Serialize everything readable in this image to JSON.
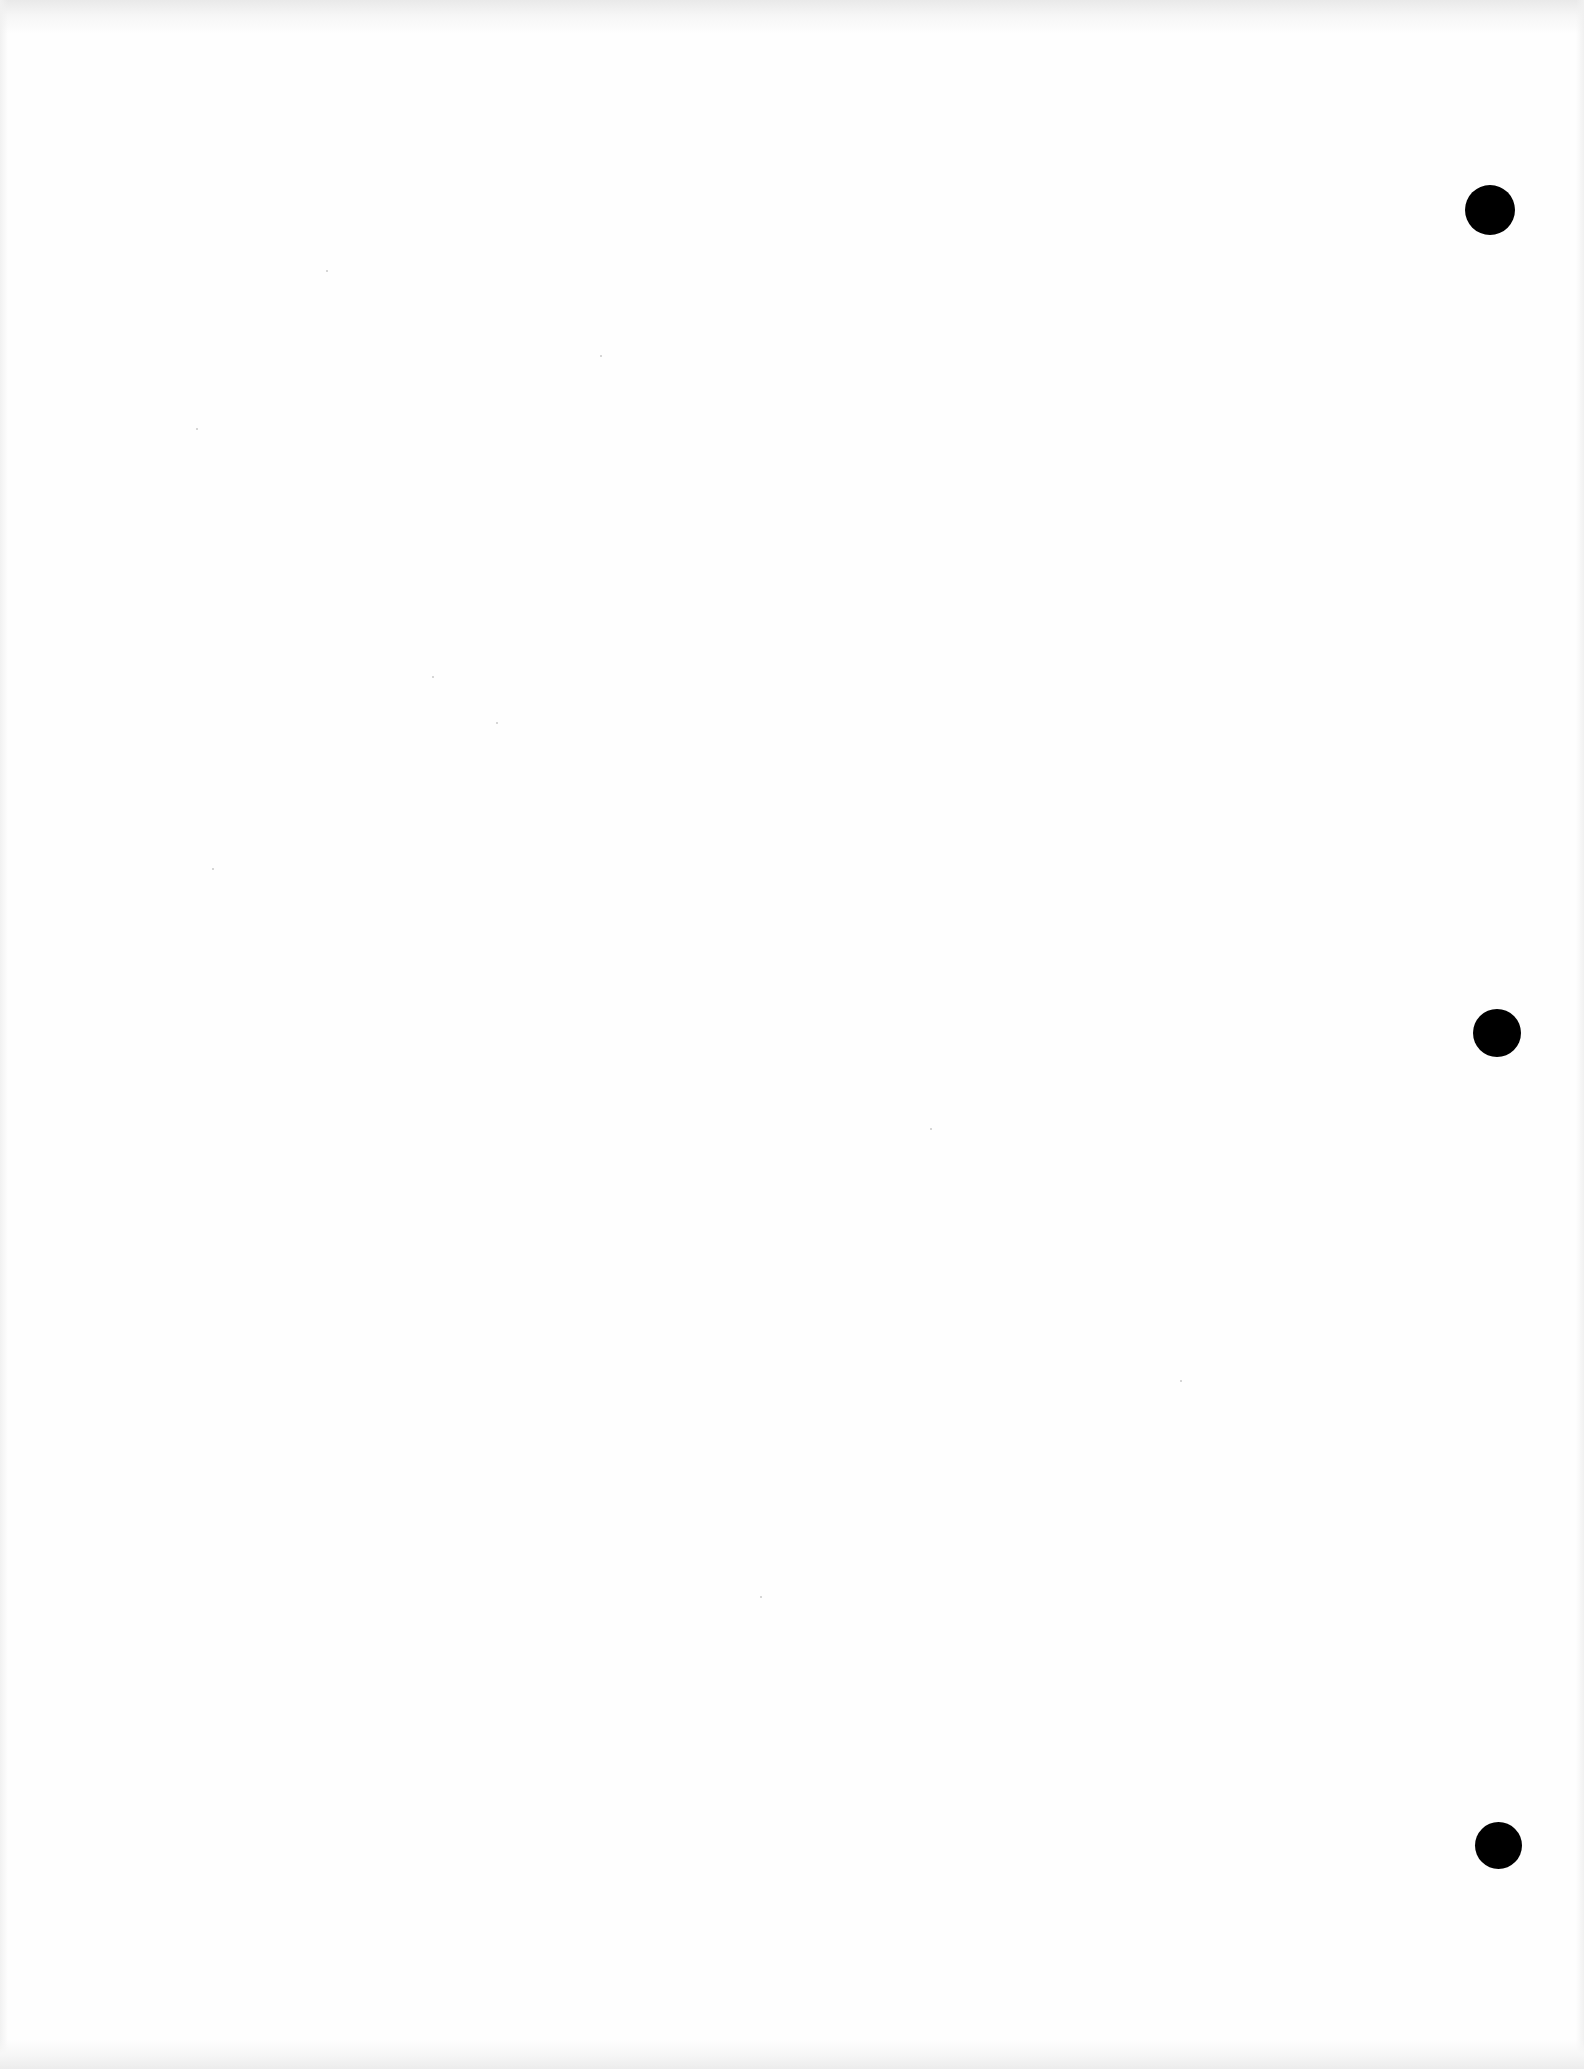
{
  "document": {
    "type": "blank scanned page",
    "text_content": "",
    "background_color": "#fefefe",
    "punch_holes": [
      {
        "cx": 1490,
        "cy": 210,
        "diameter": 50,
        "color": "#000000"
      },
      {
        "cx": 1497,
        "cy": 1033,
        "diameter": 48,
        "color": "#000000"
      },
      {
        "cx": 1498,
        "cy": 1845,
        "diameter": 47,
        "color": "#000000"
      }
    ]
  }
}
